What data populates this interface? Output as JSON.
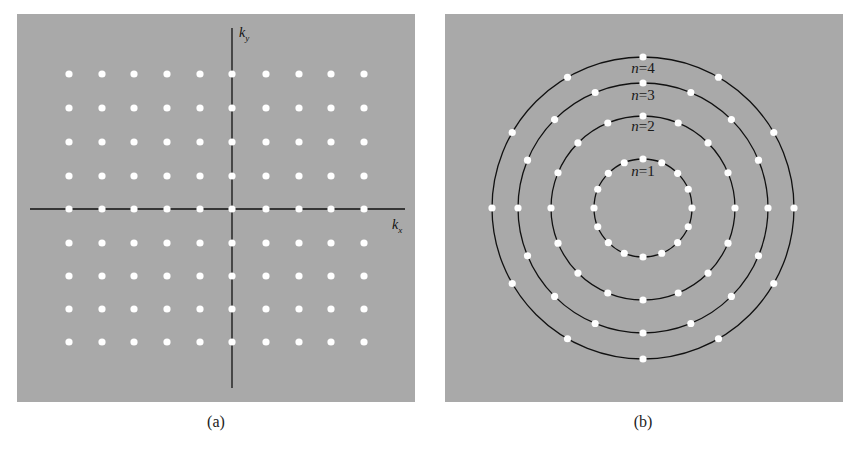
{
  "panels": [
    {
      "id": "a",
      "caption": "(a)",
      "description": "Square lattice of allowed k-states",
      "x_axis_label": "k",
      "x_axis_sub": "x",
      "y_axis_label": "k",
      "y_axis_sub": "y"
    },
    {
      "id": "b",
      "caption": "(b)",
      "description": "Circular rings of allowed states",
      "rings": [
        {
          "label_var": "n",
          "label_eq": "=1",
          "dots": 16
        },
        {
          "label_var": "n",
          "label_eq": "=2",
          "dots": 16
        },
        {
          "label_var": "n",
          "label_eq": "=3",
          "dots": 16
        },
        {
          "label_var": "n",
          "label_eq": "=4",
          "dots": 12
        }
      ]
    }
  ],
  "colors": {
    "panel_bg": "#a9a9a9",
    "dot": "#ffffff",
    "line": "#111111"
  },
  "chart_data": [
    {
      "type": "scatter",
      "title": "(a)",
      "xlabel": "k_x",
      "ylabel": "k_y",
      "grid": false,
      "description": "Rectangular lattice: 10 columns x 9 rows of white points, origin at axis crossing",
      "x": [
        -5,
        -4,
        -3,
        -2,
        -1,
        0,
        1,
        2,
        3,
        4
      ],
      "y": [
        4,
        3,
        2,
        1,
        0,
        -1,
        -2,
        -3,
        -4
      ],
      "point_count": 90
    },
    {
      "type": "scatter",
      "title": "(b)",
      "grid": false,
      "description": "Concentric circles with evenly spaced points",
      "series": [
        {
          "name": "n=1",
          "radius": 1.0,
          "points": 16
        },
        {
          "name": "n=2",
          "radius": 1.88,
          "points": 16
        },
        {
          "name": "n=3",
          "radius": 2.55,
          "points": 16
        },
        {
          "name": "n=4",
          "radius": 3.08,
          "points": 12
        }
      ]
    }
  ]
}
